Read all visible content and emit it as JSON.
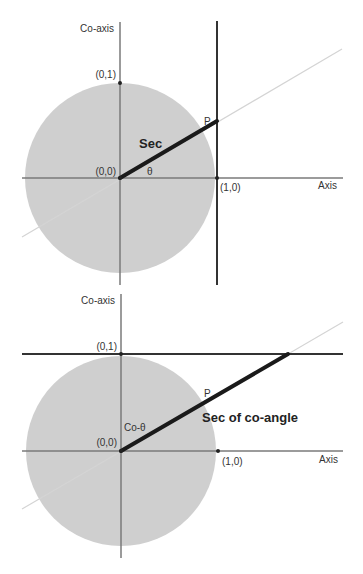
{
  "colors": {
    "circle_fill": "#cfcfcf",
    "axis": "#7a7a7a",
    "guide_line": "#d4d4d4",
    "bold_line": "#1a1a1a",
    "tangent_line": "#333333",
    "background": "#ffffff"
  },
  "diagram_top": {
    "title": "Secant diagram",
    "coaxis_label": "Co-axis",
    "axis_label": "Axis",
    "point_01": "(0,1)",
    "point_00": "(0,0)",
    "point_10": "(1,0)",
    "point_p": "P",
    "segment_label": "Sec",
    "angle_label": "θ"
  },
  "diagram_bottom": {
    "title": "Secant of co-angle diagram",
    "coaxis_label": "Co-axis",
    "axis_label": "Axis",
    "point_01": "(0,1)",
    "point_00": "(0,0)",
    "point_10": "(1,0)",
    "point_p": "P",
    "segment_label": "Sec of co-angle",
    "angle_label": "Co-θ"
  }
}
